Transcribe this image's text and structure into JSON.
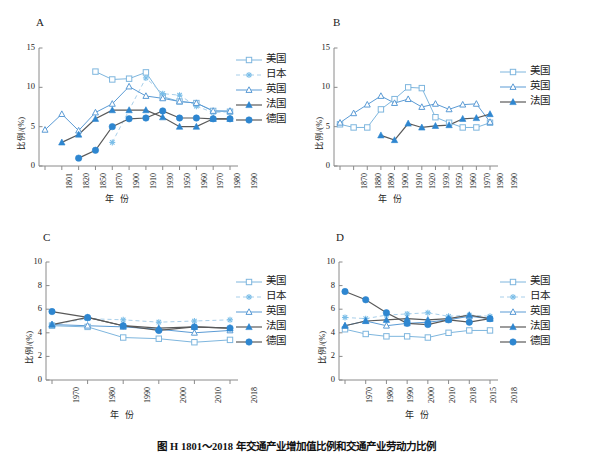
{
  "caption": "图 H   1801～2018 年交通产业增加值比例和交通产业劳动力比例",
  "axis_titles": {
    "y": "比例/(%)",
    "x": "年 份"
  },
  "series_names": {
    "usa": "美国",
    "japan": "日本",
    "uk": "英国",
    "france": "法国",
    "germany": "德国"
  },
  "colors": {
    "light_blue": "#7EB6DE",
    "mid_blue": "#5B9BD5",
    "marker_blue": "#2E86D0",
    "dark_line": "#595959",
    "axis": "#808080",
    "text": "#1a1a1a"
  },
  "panels": [
    {
      "id": "A",
      "label": "A",
      "ylim": [
        0,
        15
      ],
      "yticks": [
        0,
        5,
        10,
        15
      ],
      "categories": [
        "1801",
        "1820",
        "1850",
        "1870",
        "1900",
        "1910",
        "1930",
        "1950",
        "1960",
        "1970",
        "1980",
        "1990"
      ],
      "legend": [
        "美国",
        "日本",
        "英国",
        "法国",
        "德国"
      ],
      "series": [
        {
          "name": "美国",
          "key": "usa",
          "marker": "open-square",
          "line": "solid",
          "color": "#7EB6DE",
          "values": [
            null,
            null,
            null,
            12.0,
            11.0,
            11.1,
            11.9,
            8.8,
            8.2,
            8.0,
            7.0,
            6.9
          ]
        },
        {
          "name": "日本",
          "key": "japan",
          "marker": "asterisk",
          "line": "dashed",
          "color": "#A8CFEA",
          "values": [
            null,
            null,
            null,
            null,
            3.0,
            null,
            11.2,
            9.2,
            9.0,
            7.6,
            6.8,
            6.9
          ]
        },
        {
          "name": "英国",
          "key": "uk",
          "marker": "open-triangle",
          "line": "solid",
          "color": "#5B9BD5",
          "values": [
            4.6,
            6.6,
            4.5,
            6.8,
            7.9,
            10.1,
            8.9,
            8.6,
            8.2,
            8.0,
            7.0,
            7.0
          ]
        },
        {
          "name": "法国",
          "key": "france",
          "marker": "filled-triangle",
          "line": "solid",
          "color": "#595959",
          "values": [
            null,
            3.0,
            4.0,
            6.0,
            7.1,
            7.1,
            7.1,
            6.2,
            5.0,
            5.0,
            6.0,
            6.0
          ]
        },
        {
          "name": "德国",
          "key": "germany",
          "marker": "filled-circle",
          "line": "solid",
          "color": "#595959",
          "values": [
            null,
            null,
            1.0,
            2.0,
            5.0,
            6.0,
            6.1,
            7.0,
            6.1,
            6.1,
            6.0,
            6.0
          ]
        }
      ]
    },
    {
      "id": "B",
      "label": "B",
      "ylim": [
        0,
        15
      ],
      "yticks": [
        0,
        5,
        10,
        15
      ],
      "categories": [
        "1870",
        "1880",
        "1890",
        "1900",
        "1910",
        "1920",
        "1930",
        "1950",
        "1960",
        "1970",
        "1980",
        "1990"
      ],
      "legend": [
        "美国",
        "英国",
        "法国"
      ],
      "series": [
        {
          "name": "美国",
          "key": "usa",
          "marker": "open-square",
          "line": "solid",
          "color": "#7EB6DE",
          "values": [
            5.3,
            4.9,
            4.9,
            7.2,
            8.5,
            10.0,
            9.9,
            6.2,
            5.5,
            4.9,
            4.9,
            5.5
          ]
        },
        {
          "name": "英国",
          "key": "uk",
          "marker": "open-triangle",
          "line": "solid",
          "color": "#5B9BD5",
          "values": [
            5.5,
            6.7,
            7.8,
            8.9,
            8.0,
            8.5,
            7.5,
            7.9,
            7.2,
            7.8,
            7.9,
            5.6
          ]
        },
        {
          "name": "法国",
          "key": "france",
          "marker": "filled-triangle",
          "line": "solid",
          "color": "#595959",
          "values": [
            null,
            null,
            null,
            3.9,
            3.3,
            5.4,
            4.9,
            5.1,
            5.2,
            6.0,
            6.1,
            6.6
          ]
        }
      ]
    },
    {
      "id": "C",
      "label": "C",
      "ylim": [
        0,
        10
      ],
      "yticks": [
        0,
        2,
        4,
        6,
        8,
        10
      ],
      "categories": [
        "1970",
        "1980",
        "1990",
        "2000",
        "2010",
        "2018"
      ],
      "legend": [
        "美国",
        "日本",
        "英国",
        "法国",
        "德国"
      ],
      "series": [
        {
          "name": "美国",
          "key": "usa",
          "marker": "open-square",
          "line": "solid",
          "color": "#7EB6DE",
          "values": [
            4.6,
            4.5,
            3.6,
            3.5,
            3.2,
            3.4
          ]
        },
        {
          "name": "日本",
          "key": "japan",
          "marker": "asterisk",
          "line": "dashed",
          "color": "#A8CFEA",
          "values": [
            4.7,
            5.2,
            5.1,
            4.9,
            5.0,
            5.1
          ]
        },
        {
          "name": "英国",
          "key": "uk",
          "marker": "open-triangle",
          "line": "solid",
          "color": "#5B9BD5",
          "values": [
            4.7,
            4.6,
            4.5,
            4.3,
            4.0,
            4.2
          ]
        },
        {
          "name": "法国",
          "key": "france",
          "marker": "filled-triangle",
          "line": "solid",
          "color": "#595959",
          "values": [
            4.7,
            5.3,
            4.6,
            4.4,
            4.5,
            4.4
          ]
        },
        {
          "name": "德国",
          "key": "germany",
          "marker": "filled-circle",
          "line": "solid",
          "color": "#595959",
          "values": [
            5.8,
            5.3,
            4.6,
            4.2,
            4.5,
            4.4
          ]
        }
      ]
    },
    {
      "id": "D",
      "label": "D",
      "ylim": [
        0,
        10
      ],
      "yticks": [
        0,
        2,
        4,
        6,
        8,
        10
      ],
      "categories": [
        "1970",
        "1980",
        "1990",
        "2000",
        "2010",
        "2018",
        "2015",
        "2018"
      ],
      "legend": [
        "美国",
        "日本",
        "英国",
        "法国",
        "德国"
      ],
      "series": [
        {
          "name": "美国",
          "key": "usa",
          "marker": "open-square",
          "line": "solid",
          "color": "#7EB6DE",
          "values": [
            4.3,
            3.9,
            3.7,
            3.7,
            3.6,
            4.0,
            4.2,
            4.2
          ]
        },
        {
          "name": "日本",
          "key": "japan",
          "marker": "asterisk",
          "line": "dashed",
          "color": "#A8CFEA",
          "values": [
            5.3,
            5.2,
            5.5,
            5.6,
            5.7,
            5.4,
            5.5,
            5.4
          ]
        },
        {
          "name": "英国",
          "key": "uk",
          "marker": "open-triangle",
          "line": "solid",
          "color": "#5B9BD5",
          "values": [
            4.6,
            5.0,
            4.6,
            4.8,
            4.9,
            5.1,
            5.4,
            5.2
          ]
        },
        {
          "name": "法国",
          "key": "france",
          "marker": "filled-triangle",
          "line": "solid",
          "color": "#595959",
          "values": [
            4.6,
            5.0,
            5.1,
            5.2,
            5.1,
            5.2,
            5.5,
            5.2
          ]
        },
        {
          "name": "德国",
          "key": "germany",
          "marker": "filled-circle",
          "line": "solid",
          "color": "#595959",
          "values": [
            7.5,
            6.8,
            5.7,
            4.8,
            4.7,
            5.1,
            4.9,
            5.2
          ]
        }
      ]
    }
  ],
  "chart_data": {
    "type": "line",
    "title": "图 H   1801～2018 年交通产业增加值比例和交通产业劳动力比例",
    "xlabel": "年 份",
    "ylabel": "比例/(%)",
    "grid": false,
    "legend_position": "right",
    "panels": [
      {
        "panel": "A",
        "ylim": [
          0,
          15
        ],
        "categories": [
          "1801",
          "1820",
          "1850",
          "1870",
          "1900",
          "1910",
          "1930",
          "1950",
          "1960",
          "1970",
          "1980",
          "1990"
        ],
        "series": [
          {
            "name": "美国",
            "values": [
              null,
              null,
              null,
              12.0,
              11.0,
              11.1,
              11.9,
              8.8,
              8.2,
              8.0,
              7.0,
              6.9
            ]
          },
          {
            "name": "日本",
            "values": [
              null,
              null,
              null,
              null,
              3.0,
              null,
              11.2,
              9.2,
              9.0,
              7.6,
              6.8,
              6.9
            ]
          },
          {
            "name": "英国",
            "values": [
              4.6,
              6.6,
              4.5,
              6.8,
              7.9,
              10.1,
              8.9,
              8.6,
              8.2,
              8.0,
              7.0,
              7.0
            ]
          },
          {
            "name": "法国",
            "values": [
              null,
              3.0,
              4.0,
              6.0,
              7.1,
              7.1,
              7.1,
              6.2,
              5.0,
              5.0,
              6.0,
              6.0
            ]
          },
          {
            "name": "德国",
            "values": [
              null,
              null,
              1.0,
              2.0,
              5.0,
              6.0,
              6.1,
              7.0,
              6.1,
              6.1,
              6.0,
              6.0
            ]
          }
        ]
      },
      {
        "panel": "B",
        "ylim": [
          0,
          15
        ],
        "categories": [
          "1870",
          "1880",
          "1890",
          "1900",
          "1910",
          "1920",
          "1930",
          "1950",
          "1960",
          "1970",
          "1980",
          "1990"
        ],
        "series": [
          {
            "name": "美国",
            "values": [
              5.3,
              4.9,
              4.9,
              7.2,
              8.5,
              10.0,
              9.9,
              6.2,
              5.5,
              4.9,
              4.9,
              5.5
            ]
          },
          {
            "name": "英国",
            "values": [
              5.5,
              6.7,
              7.8,
              8.9,
              8.0,
              8.5,
              7.5,
              7.9,
              7.2,
              7.8,
              7.9,
              5.6
            ]
          },
          {
            "name": "法国",
            "values": [
              null,
              null,
              null,
              3.9,
              3.3,
              5.4,
              4.9,
              5.1,
              5.2,
              6.0,
              6.1,
              6.6
            ]
          }
        ]
      },
      {
        "panel": "C",
        "ylim": [
          0,
          10
        ],
        "categories": [
          "1970",
          "1980",
          "1990",
          "2000",
          "2010",
          "2018"
        ],
        "series": [
          {
            "name": "美国",
            "values": [
              4.6,
              4.5,
              3.6,
              3.5,
              3.2,
              3.4
            ]
          },
          {
            "name": "日本",
            "values": [
              4.7,
              5.2,
              5.1,
              4.9,
              5.0,
              5.1
            ]
          },
          {
            "name": "英国",
            "values": [
              4.7,
              4.6,
              4.5,
              4.3,
              4.0,
              4.2
            ]
          },
          {
            "name": "法国",
            "values": [
              4.7,
              5.3,
              4.6,
              4.4,
              4.5,
              4.4
            ]
          },
          {
            "name": "德国",
            "values": [
              5.8,
              5.3,
              4.6,
              4.2,
              4.5,
              4.4
            ]
          }
        ]
      },
      {
        "panel": "D",
        "ylim": [
          0,
          10
        ],
        "categories": [
          "1970",
          "1980",
          "1990",
          "2000",
          "2010",
          "2018",
          "2015",
          "2018"
        ],
        "series": [
          {
            "name": "美国",
            "values": [
              4.3,
              3.9,
              3.7,
              3.7,
              3.6,
              4.0,
              4.2,
              4.2
            ]
          },
          {
            "name": "日本",
            "values": [
              5.3,
              5.2,
              5.5,
              5.6,
              5.7,
              5.4,
              5.5,
              5.4
            ]
          },
          {
            "name": "英国",
            "values": [
              4.6,
              5.0,
              4.6,
              4.8,
              4.9,
              5.1,
              5.4,
              5.2
            ]
          },
          {
            "name": "法国",
            "values": [
              4.6,
              5.0,
              5.1,
              5.2,
              5.1,
              5.2,
              5.5,
              5.2
            ]
          },
          {
            "name": "德国",
            "values": [
              7.5,
              6.8,
              5.7,
              4.8,
              4.7,
              5.1,
              4.9,
              5.2
            ]
          }
        ]
      }
    ]
  }
}
